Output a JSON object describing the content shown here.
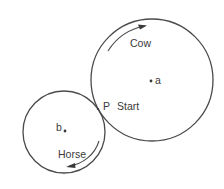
{
  "diagram": {
    "type": "tangent-circles-race",
    "circles": [
      {
        "name": "cow-track",
        "center_label": "a",
        "cx": 152,
        "cy": 80,
        "r": 61
      },
      {
        "name": "horse-track",
        "center_label": "b",
        "cx": 64,
        "cy": 132,
        "r": 41
      }
    ],
    "labels": {
      "cow": "Cow",
      "horse": "Horse",
      "point_p": "P",
      "start": "Start",
      "center_a": "a",
      "center_b": "b"
    },
    "arrows": [
      {
        "name": "cow-direction",
        "runner": "Cow",
        "direction": "clockwise"
      },
      {
        "name": "horse-direction",
        "runner": "Horse",
        "direction": "clockwise"
      }
    ],
    "colors": {
      "stroke": "#4a4a4a",
      "text": "#3a3a3a",
      "background": "#ffffff"
    }
  }
}
